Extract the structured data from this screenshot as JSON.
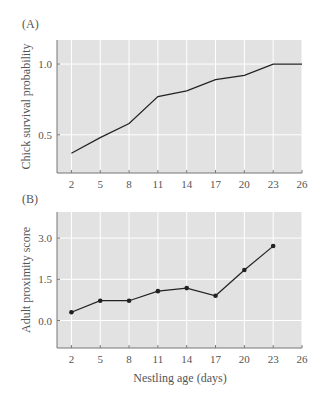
{
  "figure": {
    "panels": [
      {
        "label": "(A)",
        "ylabel": "Chick survival probability",
        "yticks": [
          "1.0",
          "0.5"
        ],
        "xticks": [
          "2",
          "5",
          "8",
          "11",
          "14",
          "17",
          "20",
          "23",
          "26"
        ]
      },
      {
        "label": "(B)",
        "ylabel": "Adult proximity score",
        "yticks": [
          "3.0",
          "1.5",
          "0.0"
        ],
        "xticks": [
          "2",
          "5",
          "8",
          "11",
          "14",
          "17",
          "20",
          "23",
          "26"
        ],
        "xlabel": "Nestling age (days)"
      }
    ]
  },
  "colors": {
    "plot_background": "#e2e2e2",
    "gridline": "#ffffff",
    "line": "#222222",
    "axis": "#777777"
  },
  "chart_data": [
    {
      "type": "line",
      "title": "(A)",
      "xlabel": "",
      "ylabel": "Chick survival probability",
      "x": [
        2,
        5,
        8,
        11,
        14,
        17,
        20,
        23,
        26
      ],
      "series": [
        {
          "name": "Chick survival probability",
          "values": [
            0.37,
            0.48,
            0.58,
            0.77,
            0.81,
            0.89,
            0.92,
            1.0,
            1.0
          ],
          "markers": false
        }
      ],
      "xticks": [
        2,
        5,
        8,
        11,
        14,
        17,
        20,
        23,
        26
      ],
      "yticks": [
        0.5,
        1.0
      ],
      "xlim": [
        0.5,
        26
      ],
      "ylim": [
        0.23,
        1.17
      ],
      "grid": true,
      "legend": "none"
    },
    {
      "type": "line",
      "title": "(B)",
      "xlabel": "Nestling age (days)",
      "ylabel": "Adult proximity score",
      "x": [
        2,
        5,
        8,
        11,
        14,
        17,
        20,
        23
      ],
      "series": [
        {
          "name": "Adult proximity score",
          "values": [
            0.3,
            0.72,
            0.72,
            1.07,
            1.18,
            0.9,
            1.84,
            2.71
          ],
          "markers": true
        }
      ],
      "xticks": [
        2,
        5,
        8,
        11,
        14,
        17,
        20,
        23,
        26
      ],
      "yticks": [
        0.0,
        1.5,
        3.0
      ],
      "xlim": [
        0.5,
        26
      ],
      "ylim": [
        -1.0,
        3.95
      ],
      "grid": true,
      "legend": "none"
    }
  ]
}
